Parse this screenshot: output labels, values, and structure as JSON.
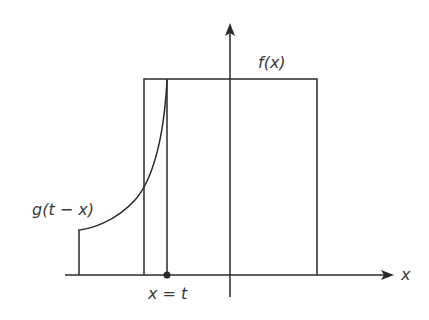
{
  "diagram": {
    "type": "convolution-illustration",
    "labels": {
      "f": "f(x)",
      "g": "g(t − x)",
      "xt": "x = t",
      "x_axis": "x"
    },
    "colors": {
      "line": "#2a2a2a",
      "background": "#ffffff"
    },
    "elements": [
      "x-axis with arrow",
      "y-axis with arrow",
      "rectangle f(x)",
      "curve g(t - x) with step at left",
      "vertical line at x = t with dot"
    ]
  }
}
